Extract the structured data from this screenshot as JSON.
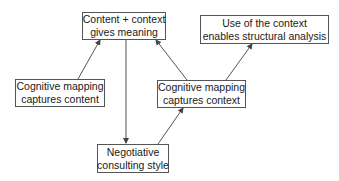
{
  "diagram": {
    "nodes": [
      {
        "id": "content-context",
        "lines": [
          "Content + context",
          "gives meaning"
        ]
      },
      {
        "id": "use-of-context",
        "lines": [
          "Use of the context",
          "enables structural analysis"
        ]
      },
      {
        "id": "cm-content",
        "lines": [
          "Cognitive mapping",
          "captures content"
        ]
      },
      {
        "id": "cm-context",
        "lines": [
          "Cognitive mapping",
          "captures context"
        ]
      },
      {
        "id": "negotiative",
        "lines": [
          "Negotiative",
          "consulting style"
        ]
      }
    ],
    "edges": [
      {
        "from": "cm-content",
        "to": "content-context"
      },
      {
        "from": "content-context",
        "to": "negotiative"
      },
      {
        "from": "cm-context",
        "to": "content-context"
      },
      {
        "from": "cm-context",
        "to": "use-of-context"
      },
      {
        "from": "negotiative",
        "to": "cm-context"
      }
    ],
    "colors": {
      "line": "#555555",
      "text": "#1a1a1a",
      "background": "#ffffff"
    }
  }
}
